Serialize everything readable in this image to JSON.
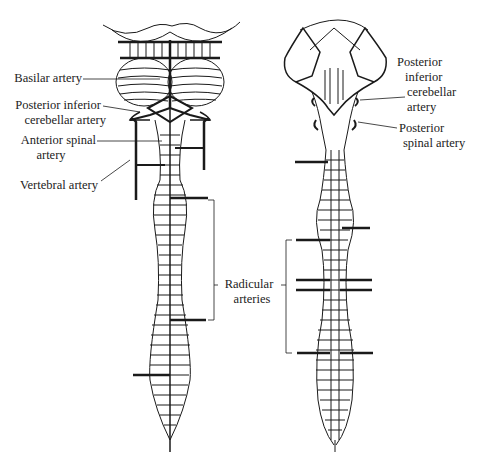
{
  "figure": {
    "left_view": {
      "name": "Anterior view",
      "labels": {
        "basilar": "Basilar artery",
        "pica_line1": "Posterior inferior",
        "pica_line2": "cerebellar artery",
        "asa_line1": "Anterior spinal",
        "asa_line2": "artery",
        "vertebral": "Vertebral artery"
      }
    },
    "center": {
      "radicular_line1": "Radicular",
      "radicular_line2": "arteries"
    },
    "right_view": {
      "name": "Posterior view",
      "labels": {
        "pica_line1": "Posterior",
        "pica_line2": "inferior",
        "pica_line3": "cerebellar",
        "pica_line4": "artery",
        "psa_line1": "Posterior",
        "psa_line2": "spinal artery"
      }
    },
    "colors": {
      "ink": "#1a1a1a",
      "background": "#ffffff"
    }
  }
}
